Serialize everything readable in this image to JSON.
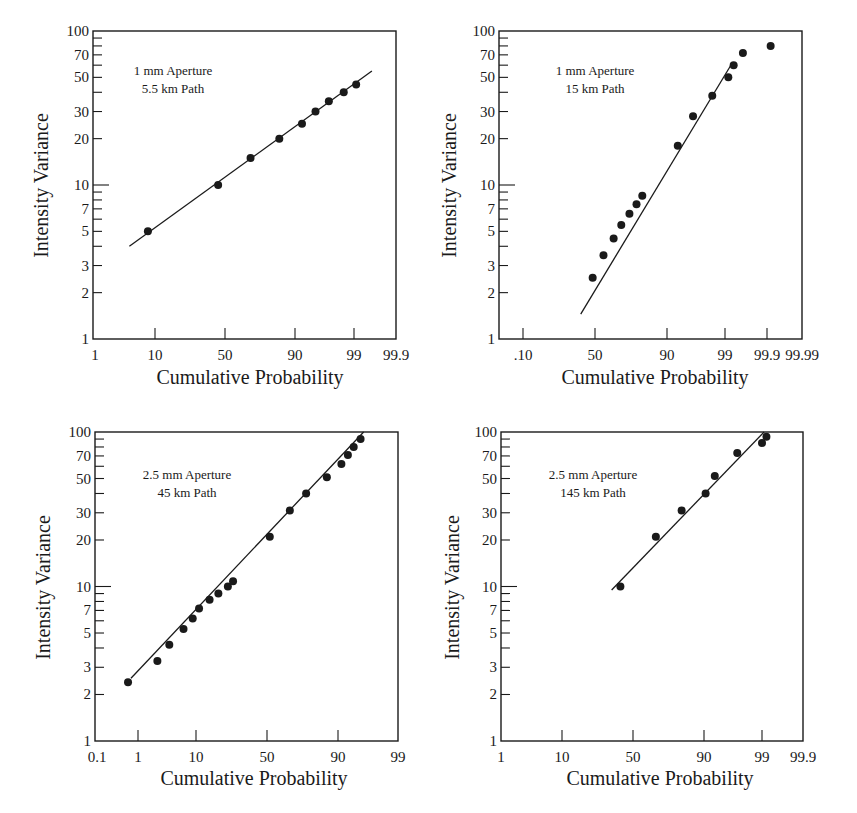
{
  "chart_data": [
    {
      "type": "scatter",
      "title": "1 mm Aperture, 5.5 km Path",
      "annotation": [
        "1 mm Aperture",
        "5.5 km Path"
      ],
      "xlabel": "Cumulative Probability",
      "ylabel": "Intensity Variance",
      "xscale": "normal-probability",
      "yscale": "log",
      "ylim": [
        1,
        100
      ],
      "x_ticks": [
        "1",
        "10",
        "50",
        "90",
        "99",
        "99.9"
      ],
      "y_tick_labels": [
        "1",
        "2",
        "3",
        "5",
        "7",
        "10",
        "20",
        "30",
        "50",
        "70",
        "100"
      ],
      "points": [
        [
          8,
          5
        ],
        [
          45,
          10
        ],
        [
          68,
          15
        ],
        [
          84,
          20
        ],
        [
          92,
          25
        ],
        [
          95,
          30
        ],
        [
          97,
          35
        ],
        [
          98.4,
          40
        ],
        [
          99.1,
          45
        ]
      ],
      "fit_line": [
        [
          4.2,
          4
        ],
        [
          99.6,
          55
        ]
      ],
      "grid": false
    },
    {
      "type": "scatter",
      "title": "1 mm Aperture, 15 km Path",
      "annotation": [
        "1 mm Aperture",
        "15 km Path"
      ],
      "xlabel": "Cumulative Probability",
      "ylabel": "Intensity Variance",
      "xscale": "normal-probability",
      "yscale": "log",
      "ylim": [
        1,
        100
      ],
      "x_ticks": [
        ".10",
        "50",
        "90",
        "99",
        "99.9",
        "99.99"
      ],
      "y_tick_labels": [
        "1",
        "2",
        "3",
        "5",
        "7",
        "10",
        "20",
        "30",
        "50",
        "70",
        "100"
      ],
      "points": [
        [
          46,
          2.5
        ],
        [
          56,
          3.5
        ],
        [
          63,
          4.5
        ],
        [
          68,
          5.5
        ],
        [
          73,
          6.5
        ],
        [
          77,
          7.5
        ],
        [
          80,
          8.5
        ],
        [
          93,
          18
        ],
        [
          96,
          28
        ],
        [
          98.2,
          38
        ],
        [
          99.15,
          50
        ],
        [
          99.35,
          60
        ],
        [
          99.6,
          72
        ],
        [
          99.92,
          80
        ]
      ],
      "fit_line": [
        [
          27,
          1.45
        ],
        [
          99.3,
          62
        ]
      ],
      "grid": false
    },
    {
      "type": "scatter",
      "title": "2.5 mm Aperture, 45 km Path",
      "annotation": [
        "2.5 mm Aperture",
        "45 km Path"
      ],
      "xlabel": "Cumulative Probability",
      "ylabel": "Intensity Variance",
      "xscale": "normal-probability",
      "yscale": "log",
      "ylim": [
        1,
        100
      ],
      "x_ticks": [
        "0.1",
        "1",
        "10",
        "50",
        "90",
        "99"
      ],
      "y_tick_labels": [
        "1",
        "2",
        "3",
        "5",
        "7",
        "10",
        "20",
        "30",
        "50",
        "70",
        "100"
      ],
      "points": [
        [
          0.6,
          2.4
        ],
        [
          2.4,
          3.3
        ],
        [
          3.9,
          4.2
        ],
        [
          6.6,
          5.3
        ],
        [
          9,
          6.2
        ],
        [
          11,
          7.2
        ],
        [
          15,
          8.2
        ],
        [
          19,
          9
        ],
        [
          24,
          10
        ],
        [
          27,
          10.8
        ],
        [
          52,
          21
        ],
        [
          66,
          31
        ],
        [
          76,
          40
        ],
        [
          86,
          51
        ],
        [
          91,
          62
        ],
        [
          92.7,
          71
        ],
        [
          94,
          80
        ],
        [
          95.3,
          90
        ]
      ],
      "fit_line": [
        [
          0.7,
          2.55
        ],
        [
          95.8,
          100
        ]
      ],
      "grid": false
    },
    {
      "type": "scatter",
      "title": "2.5 mm Aperture, 145 km Path",
      "annotation": [
        "2.5 mm Aperture",
        "145 km Path"
      ],
      "xlabel": "Cumulative Probability",
      "ylabel": "Intensity Variance",
      "xscale": "normal-probability",
      "yscale": "log",
      "ylim": [
        1,
        100
      ],
      "x_ticks": [
        "1",
        "10",
        "50",
        "90",
        "99",
        "99.9"
      ],
      "y_tick_labels": [
        "1",
        "2",
        "3",
        "5",
        "7",
        "10",
        "20",
        "30",
        "50",
        "70",
        "100"
      ],
      "points": [
        [
          41,
          10
        ],
        [
          66,
          21
        ],
        [
          81,
          31
        ],
        [
          90.5,
          40
        ],
        [
          93,
          52
        ],
        [
          97,
          73
        ],
        [
          99.0,
          85
        ],
        [
          99.2,
          93
        ]
      ],
      "fit_line": [
        [
          35,
          9.5
        ],
        [
          99.1,
          100
        ]
      ],
      "grid": false
    }
  ],
  "panels": [
    {
      "annotation_line1": "1 mm Aperture",
      "annotation_line2": "5.5 km Path",
      "xlabel": "Cumulative Probability",
      "ylabel": "Intensity Variance"
    },
    {
      "annotation_line1": "1 mm Aperture",
      "annotation_line2": "15 km Path",
      "xlabel": "Cumulative Probability",
      "ylabel": "Intensity Variance"
    },
    {
      "annotation_line1": "2.5 mm Aperture",
      "annotation_line2": "45 km Path",
      "xlabel": "Cumulative Probability",
      "ylabel": "Intensity Variance"
    },
    {
      "annotation_line1": "2.5 mm Aperture",
      "annotation_line2": "145 km Path",
      "xlabel": "Cumulative Probability",
      "ylabel": "Intensity Variance"
    }
  ],
  "colors": {
    "ink": "#1a1a1a",
    "background": "#ffffff"
  }
}
